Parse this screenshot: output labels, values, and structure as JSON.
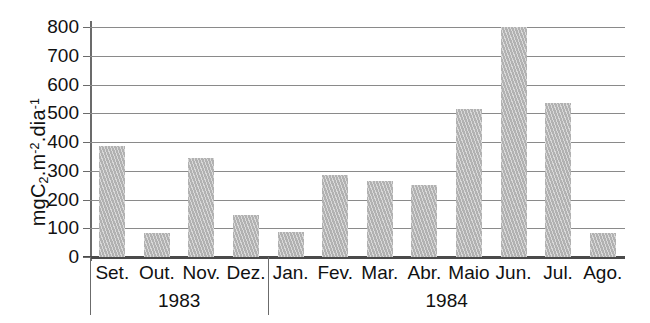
{
  "chart_data": {
    "type": "bar",
    "title": "",
    "xlabel": "",
    "ylabel": "mgC2.m-2.dia-1",
    "ylabel_parts": {
      "prefix": "mgC",
      "sub1": "2",
      "mid": ".m",
      "sup1": "-2",
      "mid2": ".dia",
      "sup2": "-1"
    },
    "categories": [
      "Set.",
      "Out.",
      "Nov.",
      "Dez.",
      "Jan.",
      "Fev.",
      "Mar.",
      "Abr.",
      "Maio",
      "Jun.",
      "Jul.",
      "Ago."
    ],
    "values": [
      385,
      85,
      345,
      145,
      88,
      285,
      265,
      252,
      515,
      800,
      535,
      85
    ],
    "ylim": [
      0,
      800
    ],
    "yticks": [
      0,
      100,
      200,
      300,
      400,
      500,
      600,
      700,
      800
    ],
    "ytick_labels": [
      "0",
      "100",
      "200",
      "300",
      "400",
      "500",
      "600",
      "700",
      "800"
    ],
    "grid": true,
    "legend": null,
    "groups": [
      {
        "label": "1983",
        "start_index": 0,
        "end_index": 3
      },
      {
        "label": "1984",
        "start_index": 4,
        "end_index": 11
      }
    ],
    "bar_color": "#bdbdbd",
    "axis_color": "#6b6b6b",
    "grid_color": "#8a8a8a",
    "background": "#ffffff"
  }
}
